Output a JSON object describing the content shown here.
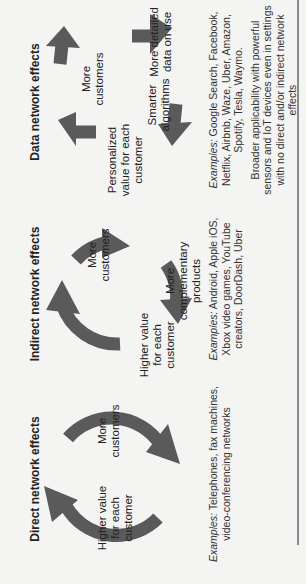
{
  "figure": {
    "orientation": "rotated-90-ccw",
    "arrow_color": "#5a5a5a",
    "rule_color": "#8a8a8a",
    "columns": [
      {
        "id": "direct",
        "title": "Direct network effects",
        "nodes": [
          "Higher value for each customer",
          "More customers"
        ],
        "node_lines": [
          [
            "Higher value",
            "for each",
            "customer"
          ],
          [
            "More",
            "customers"
          ]
        ],
        "examples_label": "Examples:",
        "examples_text": " Telephones, fax machines, video-conferencing networks"
      },
      {
        "id": "indirect",
        "title": "Indirect network effects",
        "nodes": [
          "More customers",
          "More complementary products",
          "Higher value for each customer"
        ],
        "node_lines": [
          [
            "More",
            "customers"
          ],
          [
            "More",
            "complementary",
            "products"
          ],
          [
            "Higher value",
            "for each",
            "customer"
          ]
        ],
        "examples_label": "Examples:",
        "examples_text": " Android, Apple iOS, Xbox video games, YouTube creators, DoorDash, Uber"
      },
      {
        "id": "data",
        "title": "Data network effects",
        "nodes": [
          "More customers",
          "More detailed data on use",
          "Smarter algorithms",
          "Personalized value for each customer"
        ],
        "node_lines": [
          [
            "More",
            "customers"
          ],
          [
            "More detailed",
            "data on use"
          ],
          [
            "Smarter",
            "algorithms"
          ],
          [
            "Personalized",
            "value for each",
            "customer"
          ]
        ],
        "examples_label": "Examples:",
        "examples_text": " Google Search, Facebook, Netflix, Airbnb, Waze, Uber, Amazon, Spotify, Tesla, Waymo.",
        "note": "Broader applicability with powerful sensors and IoT devices even in settings with no direct and/or indirect network effects"
      }
    ]
  }
}
